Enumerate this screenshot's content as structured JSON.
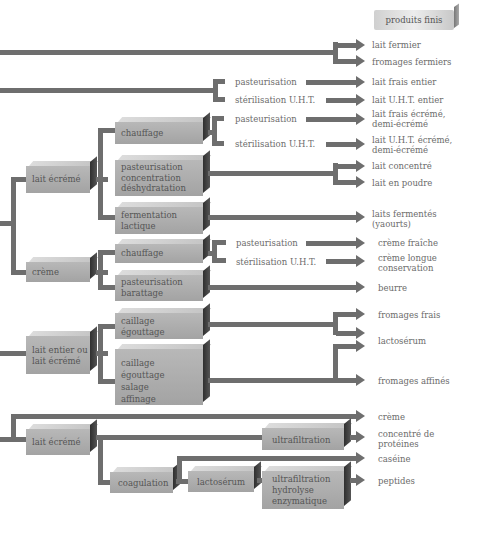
{
  "header": {
    "title": "produits finis"
  },
  "colors": {
    "line": "#6e6e6e",
    "box": "#a8a8a8",
    "text": "#6b6b6b"
  },
  "boxes": {
    "lait_ecreme_1": "lait écrémé",
    "chauffage_1": "chauffage",
    "pasteurisation_concentration": "pasteurisation\nconcentration\ndéshydratation",
    "fermentation": "fermentation\nlactique",
    "creme": "crème",
    "chauffage_2": "chauffage",
    "pasteurisation_barattage": "pasteurisation\nbarattage",
    "lait_entier_ou_ecreme": "lait entier ou\nlait écrémé",
    "caillage_egouttage": "caillage\négouttage",
    "caillage_affinage": "caillage\négouttage\nsalage\naffinage",
    "lait_ecreme_2": "lait écrémé",
    "ultrafiltration": "ultrafiltration",
    "coagulation": "coagulation",
    "lactoserum": "lactosérum",
    "ultrafiltration_hydrolyse": "ultrafiltration\nhydrolyse\nenzymatique"
  },
  "processes": {
    "p1": "pasteurisation",
    "s1": "stérilisation U.H.T.",
    "p2": "pasteurisation",
    "s2": "stérilisation U.H.T.",
    "p3": "pasteurisation",
    "s3": "stérilisation U.H.T."
  },
  "products": {
    "lait_fermier": "lait fermier",
    "fromages_fermiers": "fromages fermiers",
    "lait_frais_entier": "lait frais entier",
    "lait_uht_entier": "lait U.H.T. entier",
    "lait_frais_ecreme": "lait frais écrémé,\ndemi-écrémé",
    "lait_uht_ecreme": "lait U.H.T. écrémé,\ndemi-écrémé",
    "lait_concentre": "lait concentré",
    "lait_en_poudre": "lait en poudre",
    "laits_fermentes": "laits fermentés\n(yaourts)",
    "creme_fraiche": "crème fraîche",
    "creme_longue": "crème longue\nconservation",
    "beurre": "beurre",
    "fromages_frais": "fromages frais",
    "lactoserum": "lactosérum",
    "fromages_affines": "fromages affinés",
    "creme": "crème",
    "concentre_proteines": "concentré de\nprotéines",
    "caseine": "caséine",
    "peptides": "peptides"
  }
}
